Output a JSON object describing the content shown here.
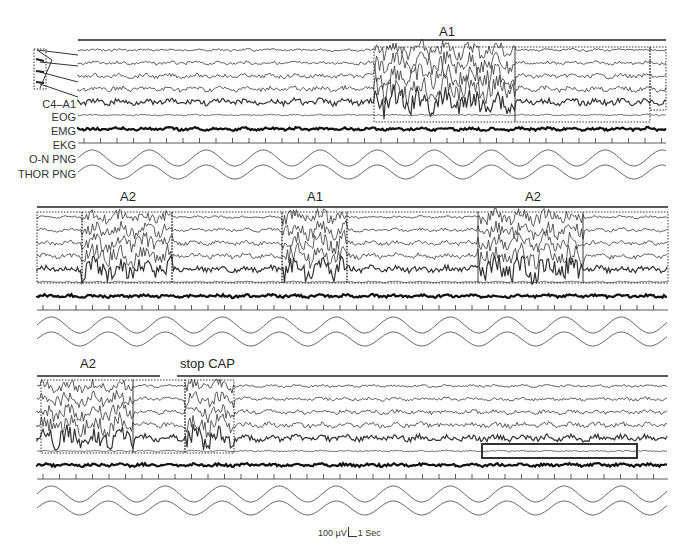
{
  "figure": {
    "panels": [
      {
        "id": "panel-1",
        "top": 40,
        "annotations": [
          {
            "label": "A1",
            "x": 447,
            "y": 4
          }
        ],
        "channel_labels": [
          "",
          "",
          "",
          "",
          "C4–A1",
          "EOG",
          "EMG",
          "EKG",
          "O-N PNG",
          "THOR PNG"
        ],
        "boxes": [
          {
            "x1": 374,
            "x2": 515,
            "y1": 47,
            "y2": 122,
            "style": "dotted"
          },
          {
            "x1": 515,
            "x2": 650,
            "y1": 47,
            "y2": 122,
            "style": "dotted"
          },
          {
            "x1": 650,
            "x2": 666,
            "y1": 47,
            "y2": 110,
            "style": "dotted"
          }
        ]
      },
      {
        "id": "panel-2",
        "top": 205,
        "annotations": [
          {
            "label": "A2",
            "x": 128,
            "y": 190
          },
          {
            "label": "A1",
            "x": 315,
            "y": 190
          },
          {
            "label": "A2",
            "x": 533,
            "y": 190
          }
        ],
        "channel_labels": [],
        "boxes": [
          {
            "x1": 37,
            "x2": 82,
            "y1": 212,
            "y2": 283,
            "style": "dotted"
          },
          {
            "x1": 82,
            "x2": 172,
            "y1": 212,
            "y2": 283,
            "style": "dotted"
          },
          {
            "x1": 172,
            "x2": 282,
            "y1": 212,
            "y2": 283,
            "style": "dotted"
          },
          {
            "x1": 282,
            "x2": 347,
            "y1": 212,
            "y2": 283,
            "style": "dotted"
          },
          {
            "x1": 347,
            "x2": 478,
            "y1": 212,
            "y2": 283,
            "style": "dotted"
          },
          {
            "x1": 478,
            "x2": 583,
            "y1": 212,
            "y2": 283,
            "style": "dotted"
          },
          {
            "x1": 583,
            "x2": 668,
            "y1": 212,
            "y2": 283,
            "style": "dotted"
          }
        ]
      },
      {
        "id": "panel-3",
        "top": 372,
        "annotations": [
          {
            "label": "A2",
            "x": 88,
            "y": 357
          },
          {
            "label": "stop CAP",
            "x": 208,
            "y": 357
          }
        ],
        "channel_labels": [],
        "boxes": [
          {
            "x1": 41,
            "x2": 133,
            "y1": 380,
            "y2": 453,
            "style": "dotted"
          },
          {
            "x1": 133,
            "x2": 185,
            "y1": 380,
            "y2": 453,
            "style": "dotted"
          },
          {
            "x1": 185,
            "x2": 234,
            "y1": 380,
            "y2": 453,
            "style": "dotted"
          },
          {
            "x1": 482,
            "x2": 637,
            "y1": 444,
            "y2": 458,
            "style": "solid"
          }
        ]
      }
    ],
    "scale_bar": {
      "amplitude": "100 µV",
      "time": "1 Sec"
    }
  }
}
